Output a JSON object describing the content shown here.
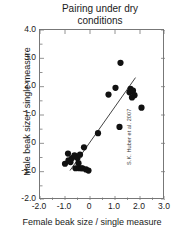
{
  "chart_data": {
    "type": "scatter",
    "title": "Pairing under dry\nconditions",
    "title_line1": "Pairing under dry",
    "title_line2": "conditions",
    "xlabel": "Female beak size / single measure",
    "ylabel": "Male beak size / single measure",
    "xlim": [
      -2.0,
      3.0
    ],
    "ylim": [
      -2.0,
      4.0
    ],
    "grid": false,
    "legend": null,
    "xticks": [
      "-2.0",
      "-1.0",
      "0",
      "1.0",
      "2.0",
      "3.0"
    ],
    "xtick_values": [
      -2.0,
      -1.0,
      0,
      1.0,
      2.0,
      3.0
    ],
    "yticks": [
      "4.0",
      "3.0",
      "2.0",
      "1.0",
      "0",
      "-1.0",
      "-2.0"
    ],
    "ytick_values": [
      4.0,
      3.0,
      2.0,
      1.0,
      0,
      -1.0,
      -2.0
    ],
    "minor_tick_interval": 0.5,
    "point_color": "#111111",
    "line_color": "#444444",
    "series": [
      {
        "name": "pairs",
        "x": [
          -1.0,
          -0.88,
          -0.86,
          -0.78,
          -0.72,
          -0.62,
          -0.58,
          -0.5,
          -0.46,
          -0.44,
          -0.4,
          -0.34,
          -0.3,
          -0.24,
          -0.16,
          -0.06,
          0.32,
          0.74,
          1.02,
          1.18,
          1.22,
          1.58,
          1.62,
          1.68,
          1.72,
          1.78,
          2.06
        ],
        "y": [
          -0.72,
          -0.36,
          -0.6,
          -0.66,
          -0.52,
          -0.42,
          -0.88,
          -0.52,
          -0.7,
          -0.88,
          -0.4,
          -0.88,
          -0.88,
          -0.14,
          -0.92,
          -0.96,
          0.36,
          1.72,
          1.96,
          0.58,
          2.84,
          1.8,
          1.92,
          1.62,
          1.86,
          1.7,
          1.26
        ]
      }
    ],
    "trendline": {
      "name": "regression-line",
      "x_start": -0.8,
      "y_start": -0.96,
      "x_end": 1.82,
      "y_end": 2.32
    }
  },
  "credit": {
    "text": "S.K. Huber et al. 2007"
  }
}
